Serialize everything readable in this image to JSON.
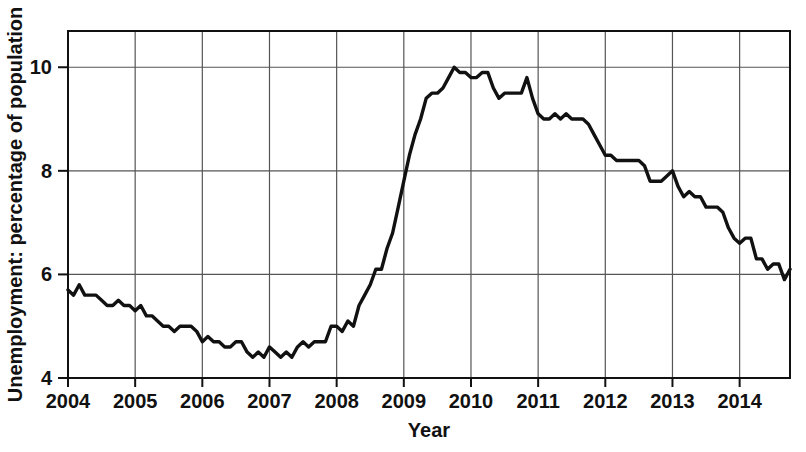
{
  "chart_data": {
    "type": "line",
    "title": "",
    "xlabel": "Year",
    "ylabel": "Unemployment: percentage of population",
    "xlim": [
      2004.0,
      2014.75
    ],
    "ylim": [
      4.0,
      10.7
    ],
    "xticks": [
      "2004",
      "2005",
      "2006",
      "2007",
      "2008",
      "2009",
      "2010",
      "2011",
      "2012",
      "2013",
      "2014"
    ],
    "xtick_values": [
      2004,
      2005,
      2006,
      2007,
      2008,
      2009,
      2010,
      2011,
      2012,
      2013,
      2014
    ],
    "yticks": [
      "4",
      "6",
      "8",
      "10"
    ],
    "ytick_values": [
      4,
      6,
      8,
      10
    ],
    "grid": "both",
    "legend": "none",
    "series": [
      {
        "name": "Unemployment rate",
        "color": "#111111",
        "x": [
          2004.0,
          2004.083,
          2004.167,
          2004.25,
          2004.333,
          2004.417,
          2004.5,
          2004.583,
          2004.667,
          2004.75,
          2004.833,
          2004.917,
          2005.0,
          2005.083,
          2005.167,
          2005.25,
          2005.333,
          2005.417,
          2005.5,
          2005.583,
          2005.667,
          2005.75,
          2005.833,
          2005.917,
          2006.0,
          2006.083,
          2006.167,
          2006.25,
          2006.333,
          2006.417,
          2006.5,
          2006.583,
          2006.667,
          2006.75,
          2006.833,
          2006.917,
          2007.0,
          2007.083,
          2007.167,
          2007.25,
          2007.333,
          2007.417,
          2007.5,
          2007.583,
          2007.667,
          2007.75,
          2007.833,
          2007.917,
          2008.0,
          2008.083,
          2008.167,
          2008.25,
          2008.333,
          2008.417,
          2008.5,
          2008.583,
          2008.667,
          2008.75,
          2008.833,
          2008.917,
          2009.0,
          2009.083,
          2009.167,
          2009.25,
          2009.333,
          2009.417,
          2009.5,
          2009.583,
          2009.667,
          2009.75,
          2009.833,
          2009.917,
          2010.0,
          2010.083,
          2010.167,
          2010.25,
          2010.333,
          2010.417,
          2010.5,
          2010.583,
          2010.667,
          2010.75,
          2010.833,
          2010.917,
          2011.0,
          2011.083,
          2011.167,
          2011.25,
          2011.333,
          2011.417,
          2011.5,
          2011.583,
          2011.667,
          2011.75,
          2011.833,
          2011.917,
          2012.0,
          2012.083,
          2012.167,
          2012.25,
          2012.333,
          2012.417,
          2012.5,
          2012.583,
          2012.667,
          2012.75,
          2012.833,
          2012.917,
          2013.0,
          2013.083,
          2013.167,
          2013.25,
          2013.333,
          2013.417,
          2013.5,
          2013.583,
          2013.667,
          2013.75,
          2013.833,
          2013.917,
          2014.0,
          2014.083,
          2014.167,
          2014.25,
          2014.333,
          2014.417,
          2014.5,
          2014.583,
          2014.667,
          2014.75
        ],
        "values": [
          5.7,
          5.6,
          5.8,
          5.6,
          5.6,
          5.6,
          5.5,
          5.4,
          5.4,
          5.5,
          5.4,
          5.4,
          5.3,
          5.4,
          5.2,
          5.2,
          5.1,
          5.0,
          5.0,
          4.9,
          5.0,
          5.0,
          5.0,
          4.9,
          4.7,
          4.8,
          4.7,
          4.7,
          4.6,
          4.6,
          4.7,
          4.7,
          4.5,
          4.4,
          4.5,
          4.4,
          4.6,
          4.5,
          4.4,
          4.5,
          4.4,
          4.6,
          4.7,
          4.6,
          4.7,
          4.7,
          4.7,
          5.0,
          5.0,
          4.9,
          5.1,
          5.0,
          5.4,
          5.6,
          5.8,
          6.1,
          6.1,
          6.5,
          6.8,
          7.3,
          7.8,
          8.3,
          8.7,
          9.0,
          9.4,
          9.5,
          9.5,
          9.6,
          9.8,
          10.0,
          9.9,
          9.9,
          9.8,
          9.8,
          9.9,
          9.9,
          9.6,
          9.4,
          9.5,
          9.5,
          9.5,
          9.5,
          9.8,
          9.4,
          9.1,
          9.0,
          9.0,
          9.1,
          9.0,
          9.1,
          9.0,
          9.0,
          9.0,
          8.9,
          8.7,
          8.5,
          8.3,
          8.3,
          8.2,
          8.2,
          8.2,
          8.2,
          8.2,
          8.1,
          7.8,
          7.8,
          7.8,
          7.9,
          8.0,
          7.7,
          7.5,
          7.6,
          7.5,
          7.5,
          7.3,
          7.3,
          7.3,
          7.2,
          6.9,
          6.7,
          6.6,
          6.7,
          6.7,
          6.3,
          6.3,
          6.1,
          6.2,
          6.2,
          5.9,
          6.1
        ]
      }
    ]
  }
}
